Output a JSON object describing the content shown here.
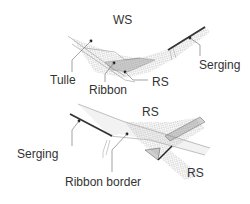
{
  "figure": {
    "top": {
      "labels": {
        "ws": "WS",
        "tulle": "Tulle",
        "ribbon": "Ribbon",
        "rs": "RS",
        "serging": "Serging"
      }
    },
    "bottom": {
      "labels": {
        "rs_top": "RS",
        "rs_bottom": "RS",
        "serging": "Serging",
        "ribbon_border": "Ribbon border"
      }
    }
  }
}
